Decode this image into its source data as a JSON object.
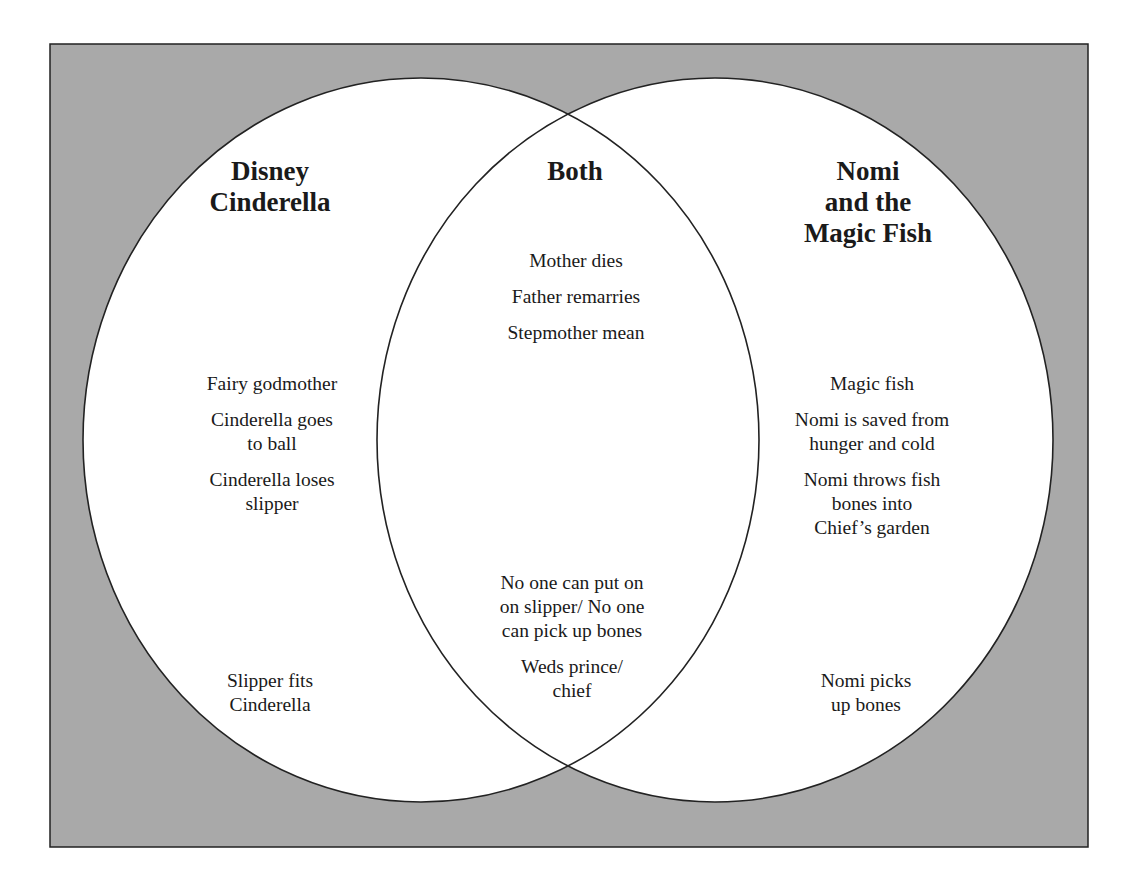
{
  "diagram": {
    "type": "venn",
    "colors": {
      "background": "#a9a9a9",
      "circle_fill": "#ffffff",
      "stroke": "#222222"
    },
    "sets": [
      {
        "id": "left",
        "heading": [
          "Disney",
          "Cinderella"
        ],
        "items_top": [
          [
            "Fairy godmother"
          ],
          [
            "Cinderella goes",
            "to ball"
          ],
          [
            "Cinderella loses",
            "slipper"
          ]
        ],
        "items_bottom": [
          [
            "Slipper fits",
            "Cinderella"
          ]
        ]
      },
      {
        "id": "both",
        "heading": [
          "Both"
        ],
        "items_top": [
          [
            "Mother dies"
          ],
          [
            "Father remarries"
          ],
          [
            "Stepmother mean"
          ]
        ],
        "items_bottom": [
          [
            "No one can put on",
            "on slipper/ No one",
            "can pick up bones"
          ],
          [
            "Weds prince/",
            "chief"
          ]
        ]
      },
      {
        "id": "right",
        "heading": [
          "Nomi",
          "and the",
          "Magic Fish"
        ],
        "items_top": [
          [
            "Magic fish"
          ],
          [
            "Nomi is saved from",
            "hunger and cold"
          ],
          [
            "Nomi throws fish",
            "bones into",
            "Chief’s garden"
          ]
        ],
        "items_bottom": [
          [
            "Nomi picks",
            "up bones"
          ]
        ]
      }
    ]
  }
}
